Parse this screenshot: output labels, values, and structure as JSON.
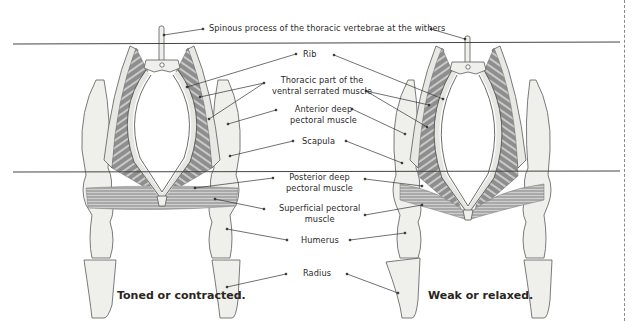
{
  "diagram": {
    "labels": {
      "spinous_process": "Spinous process of the thoracic vertebrae at the withers",
      "rib": "Rib",
      "serrated_line1": "Thoracic part of the",
      "serrated_line2": "ventral serrated muscle",
      "ant_pect_line1": "Anterior deep",
      "ant_pect_line2": "pectoral muscle",
      "scapula": "Scapula",
      "post_pect_line1": "Posterior deep",
      "post_pect_line2": "pectoral muscle",
      "sup_pect_line1": "Superficial pectoral",
      "sup_pect_line2": "muscle",
      "humerus": "Humerus",
      "radius": "Radius"
    },
    "captions": {
      "left": "Toned or contracted.",
      "right": "Weak or relaxed."
    },
    "colors": {
      "bone": "#efefec",
      "bone_outline": "#5a5a5a",
      "muscle": "#8c8c8c",
      "muscle_light": "#b4b4b4",
      "reference_line": "#444444"
    }
  }
}
